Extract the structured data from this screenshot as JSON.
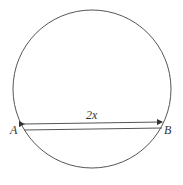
{
  "diagram": {
    "circle": {
      "cx": 92,
      "cy": 89,
      "r": 79,
      "stroke": "#555555"
    },
    "chord": {
      "from": "A",
      "to": "B",
      "y": 129
    },
    "dimension": {
      "label": "2x",
      "y": 123
    },
    "points": [
      {
        "name": "A",
        "label": "A"
      },
      {
        "name": "B",
        "label": "B"
      }
    ]
  }
}
